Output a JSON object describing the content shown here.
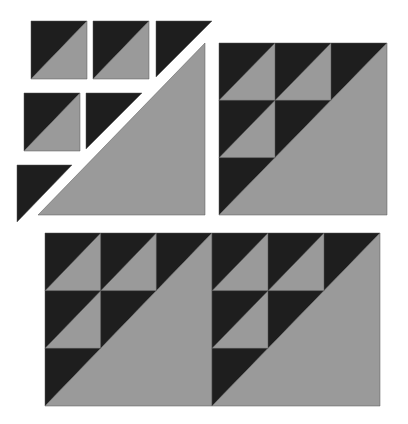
{
  "diagram": {
    "type": "quilt-block-assembly",
    "colors": {
      "dark": "#1e1e1e",
      "light": "#9a9a9a",
      "background": "#ffffff",
      "edge": "#555555"
    },
    "exploded_pieces": {
      "hst_units": [
        {
          "id": "hst-r1c1",
          "x": 31,
          "y": 21,
          "size": 56
        },
        {
          "id": "hst-r1c2",
          "x": 93,
          "y": 21,
          "size": 56
        },
        {
          "id": "hst-r2c1",
          "x": 24,
          "y": 93,
          "size": 56
        }
      ],
      "dark_triangles": [
        {
          "id": "dark-tri-r1c3",
          "points": "156,21 212,21 156,77"
        },
        {
          "id": "dark-tri-r2c2",
          "points": "86,93 142,93 86,149"
        },
        {
          "id": "dark-tri-r3c1",
          "points": "17,165 72,165 17,222"
        }
      ],
      "large_light_triangle": {
        "id": "large-light-triangle",
        "points": "205,43 205,215 38,215"
      }
    },
    "assembled_block": {
      "id": "assembled-block",
      "x": 219,
      "y": 43,
      "w": 168,
      "h": 172
    },
    "repeated_blocks": [
      {
        "id": "row-block-1",
        "x": 45,
        "y": 233,
        "w": 167,
        "h": 173
      },
      {
        "id": "row-block-2",
        "x": 212,
        "y": 233,
        "w": 168,
        "h": 173
      }
    ]
  }
}
